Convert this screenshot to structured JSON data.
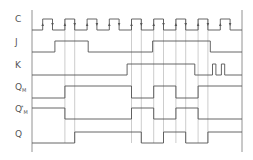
{
  "signals": [
    {
      "id": "C",
      "label": "C",
      "sub": "",
      "sup": ""
    },
    {
      "id": "J",
      "label": "J",
      "sub": "",
      "sup": ""
    },
    {
      "id": "K",
      "label": "K",
      "sub": "",
      "sup": ""
    },
    {
      "id": "QM",
      "label": "Q",
      "sub": "M",
      "sup": ""
    },
    {
      "id": "QMstar",
      "label": "Q",
      "sub": "M",
      "sup": "*"
    },
    {
      "id": "Q",
      "label": "Q",
      "sub": "",
      "sup": ""
    }
  ],
  "colors": {
    "line": "#555555",
    "guide": "#9a9a9a",
    "label": "#555555"
  },
  "timing": {
    "clock_periods": 9,
    "clock_initial": 0,
    "J_transitions_period": [
      0.55,
      2.05,
      4.95,
      7.55
    ],
    "K_transitions_period": [
      3.8,
      6.85,
      7.65,
      7.8,
      8.05,
      8.2
    ],
    "QM_initial": 0,
    "QM_transitions_clock_rise": [
      2,
      5,
      6,
      7,
      8
    ],
    "QMstar_initial": 1,
    "QMstar_transitions_clock_rise": [
      2,
      5,
      6,
      7,
      8
    ],
    "Q_initial": 0,
    "Q_transitions_clock_fall": [
      2,
      5,
      6,
      7,
      8
    ]
  }
}
